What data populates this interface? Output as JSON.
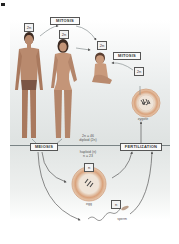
{
  "diagram": {
    "labels": {
      "mitosis_top": "MITOSIS",
      "mitosis_right": "MITOSIS",
      "meiosis": "MEIOSIS",
      "fertilization": "FERTILIZATION",
      "diploid_line1": "2n = 46",
      "diploid_line2": "diploid (2n)",
      "haploid_line1": "haploid (n)",
      "haploid_line2": "n = 23",
      "zygote": "zygote",
      "egg": "egg",
      "sperm": "sperm"
    },
    "ploidy_tags": {
      "male": "2n",
      "female": "2n",
      "baby": "2n",
      "zygote": "2n",
      "egg": "n",
      "sperm": "n"
    },
    "colors": {
      "skin": "#b98a6e",
      "hair": "#3b2a22",
      "cell_ring": "#d9a27c",
      "cell_inner": "#efe4d8",
      "arrow": "#5a5a5a",
      "background": "#e4e7e6"
    }
  }
}
